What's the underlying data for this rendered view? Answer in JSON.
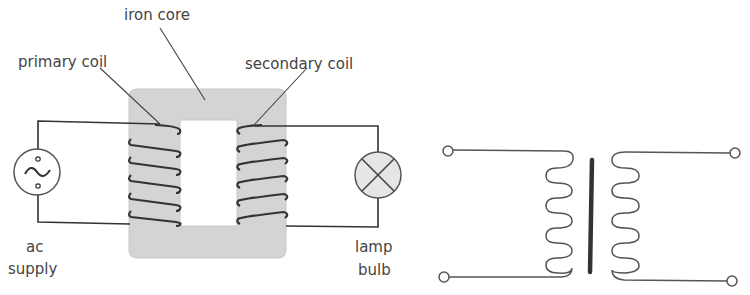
{
  "labels": {
    "iron_core": "iron core",
    "primary_coil": "primary coil",
    "secondary_coil": "secondary coil",
    "ac_line1": "ac",
    "ac_line2": "supply",
    "lamp_line1": "lamp",
    "lamp_line2": "bulb"
  },
  "colors": {
    "core_fill": "#d4d4d4",
    "wire": "#333333",
    "lamp_fill": "#e6e6e6",
    "text": "#444444"
  },
  "icons": {
    "ac_supply": "ac-source-icon",
    "lamp": "lamp-icon",
    "transformer_symbol": "transformer-symbol-icon"
  }
}
